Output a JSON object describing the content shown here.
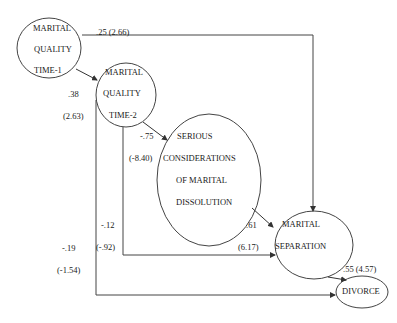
{
  "nodes": {
    "mq1": {
      "lines": [
        "MARITAL",
        "QUALITY",
        "TIME-1"
      ]
    },
    "mq2": {
      "lines": [
        "MARITAL",
        "QUALITY",
        "TIME-2"
      ]
    },
    "scmd": {
      "lines": [
        "SERIOUS",
        "CONSIDERATIONS",
        "OF MARITAL",
        "DISSOLUTION"
      ]
    },
    "sep": {
      "lines": [
        "MARITAL",
        "SEPARATION"
      ]
    },
    "div": {
      "lines": [
        "DIVORCE"
      ]
    }
  },
  "paths": {
    "mq1_to_sep": {
      "coef": ".25 (2.66)"
    },
    "mq1_to_mq2": {
      "coef": ".38",
      "t": "(2.63)"
    },
    "mq2_to_scmd": {
      "coef": "-.75",
      "t": "(-8.40)"
    },
    "mq2_to_sep": {
      "coef": "-.12",
      "t": "(-.92)"
    },
    "mq2_to_div": {
      "coef": "-.19",
      "t": "(-1.54)"
    },
    "scmd_to_sep": {
      "coef": ".61",
      "t": "(6.17)"
    },
    "sep_to_div": {
      "coef": ".55 (4.57)"
    }
  },
  "colors": {
    "line": "#333333",
    "background": "#ffffff"
  }
}
